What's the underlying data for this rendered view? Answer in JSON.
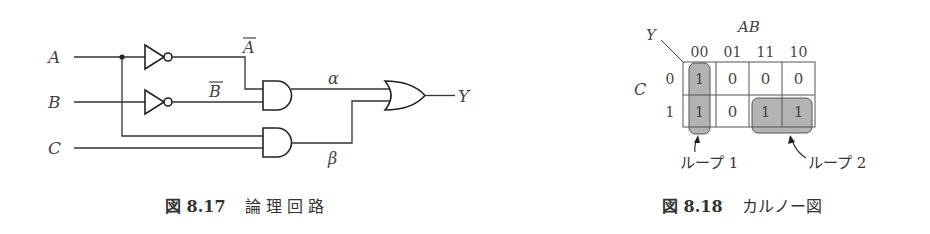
{
  "circuit": {
    "inputs": {
      "a": "A",
      "b": "B",
      "c": "C"
    },
    "inverter_labels": {
      "a_bar": "A",
      "b_bar": "B"
    },
    "intermediate": {
      "alpha": "α",
      "beta": "β"
    },
    "output": "Y",
    "gates": [
      "NOT(A)",
      "NOT(B)",
      "AND(Ā,B̄)",
      "AND(A,C)",
      "OR(α,β)"
    ],
    "caption": {
      "number": "図 8.17",
      "title": "論 理 回 路"
    }
  },
  "kmap": {
    "output_label": "Y",
    "col_var": "AB",
    "row_var": "C",
    "col_headers": [
      "00",
      "01",
      "11",
      "10"
    ],
    "row_headers": [
      "0",
      "1"
    ],
    "cells": [
      [
        "1",
        "0",
        "0",
        "0"
      ],
      [
        "1",
        "0",
        "1",
        "1"
      ]
    ],
    "loops": [
      {
        "label": "ループ 1",
        "cells": "column 00 (C=0,1)"
      },
      {
        "label": "ループ 2",
        "cells": "C=1, AB=11,10"
      }
    ],
    "loop_fill": "#b3b3b3",
    "caption": {
      "number": "図 8.18",
      "title": "カルノー図"
    }
  }
}
